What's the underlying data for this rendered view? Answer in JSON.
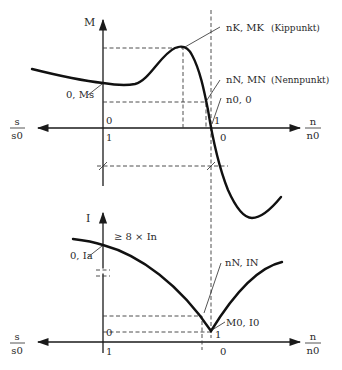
{
  "top_diagram": {
    "y_axis_label": "M",
    "x_axis_left_label_num": "s",
    "x_axis_left_label_den": "s0",
    "x_axis_right_label_num": "n",
    "x_axis_right_label_den": "n0",
    "tick_left_above": "0",
    "tick_left_below": "1",
    "tick_right_above": "1",
    "tick_right_below": "0",
    "point_start": "0, Ms",
    "point_kipp": "nK, MK",
    "point_kipp_note": "(Kippunkt)",
    "point_nenn": "nN, MN",
    "point_nenn_note": "(Nennpunkt)",
    "point_sync": "n0, 0"
  },
  "bottom_diagram": {
    "y_axis_label": "I",
    "x_axis_left_label_num": "s",
    "x_axis_left_label_den": "s0",
    "x_axis_right_label_num": "n",
    "x_axis_right_label_den": "n0",
    "tick_left_above": "0",
    "tick_left_below": "1",
    "tick_right_above": "1",
    "tick_right_below": "0",
    "point_start": "0, Ia",
    "start_current_note": "≥ 8 × In",
    "point_nenn": "nN, IN",
    "point_idle": "M0, I0"
  }
}
